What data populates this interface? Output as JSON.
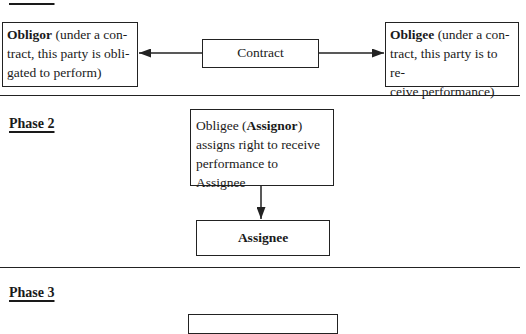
{
  "phases": [
    {
      "label": "Phase 1",
      "obligor": {
        "bold": "Obligor",
        "line1": " (under a con-",
        "line2": "tract, this party is obli-",
        "line3": "gated to perform)"
      },
      "contract": {
        "label": "Contract"
      },
      "obligee": {
        "bold": "Obligee",
        "line1": " (under a con-",
        "line2": "tract, this party is to re-",
        "line3": "ceive performance)"
      }
    },
    {
      "label": "Phase 2",
      "assignor": {
        "pre": "Obligee (",
        "bold": "Assignor",
        "post": ")",
        "line2": "assigns right to receive",
        "line3": "performance to Assignee"
      },
      "assignee": {
        "label": "Assignee"
      }
    },
    {
      "label": "Phase 3"
    }
  ]
}
